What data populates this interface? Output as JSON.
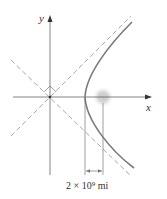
{
  "figure": {
    "type": "hyperbola-orbit-diagram",
    "axes": {
      "x_label": "x",
      "y_label": "y"
    },
    "elements": [
      "hyperbola branch",
      "two dashed asymptotes",
      "right-angle marker between asymptotes",
      "focus (sun) glow",
      "distance dimension"
    ],
    "dimension_label": "2 × 10⁹ mi",
    "colors": {
      "axes": "#555555",
      "curve": "#777777",
      "asymptote": "#999999",
      "glow": "#bbbbbb"
    }
  }
}
